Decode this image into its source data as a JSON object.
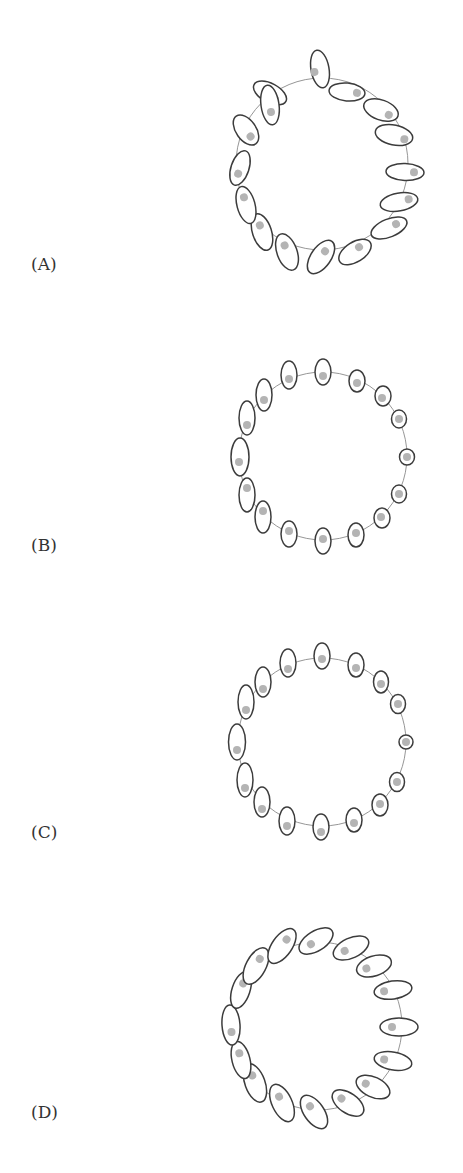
{
  "figure": {
    "colors": {
      "stroke": "#3c3c3c",
      "ring": "#8a8a8a",
      "dot": "#b4b4b4",
      "label": "#333333"
    },
    "panels": [
      {
        "label": "(A)",
        "label_pos": [
          31,
          270
        ],
        "ring": {
          "cx": 322,
          "cy": 164,
          "r": 86
        },
        "ellipses": [
          {
            "cx": 270,
            "cy": 93,
            "rx": 18,
            "ry": 9.5,
            "angle": 28,
            "dot": [
              7,
              3
            ]
          },
          {
            "cx": 320,
            "cy": 69,
            "rx": 19,
            "ry": 9,
            "angle": 80,
            "dot": [
              2,
              6
            ]
          },
          {
            "cx": 347,
            "cy": 92,
            "rx": 18,
            "ry": 9,
            "angle": 5,
            "dot": [
              10,
              0
            ]
          },
          {
            "cx": 381,
            "cy": 110,
            "rx": 18,
            "ry": 10,
            "angle": 20,
            "dot": [
              9,
              2
            ]
          },
          {
            "cx": 394,
            "cy": 135,
            "rx": 19,
            "ry": 10,
            "angle": 12,
            "dot": [
              11,
              2
            ]
          },
          {
            "cx": 405,
            "cy": 172,
            "rx": 19,
            "ry": 8.5,
            "angle": 2,
            "dot": [
              9,
              0
            ]
          },
          {
            "cx": 399,
            "cy": 202,
            "rx": 19,
            "ry": 9,
            "angle": -10,
            "dot": [
              10,
              -1
            ]
          },
          {
            "cx": 389,
            "cy": 228,
            "rx": 19,
            "ry": 9,
            "angle": -22,
            "dot": [
              8,
              -1
            ]
          },
          {
            "cx": 355,
            "cy": 252,
            "rx": 18,
            "ry": 10,
            "angle": -32,
            "dot": [
              6,
              -2
            ]
          },
          {
            "cx": 321,
            "cy": 257,
            "rx": 19,
            "ry": 10,
            "angle": -55,
            "dot": [
              7,
              0
            ]
          },
          {
            "cx": 287,
            "cy": 252,
            "rx": 19,
            "ry": 10,
            "angle": 70,
            "dot": [
              -7,
              0
            ]
          },
          {
            "cx": 262,
            "cy": 232,
            "rx": 19,
            "ry": 9.5,
            "angle": 72,
            "dot": [
              -7,
              0
            ]
          },
          {
            "cx": 246,
            "cy": 205,
            "rx": 19,
            "ry": 9,
            "angle": 75,
            "dot": [
              -8,
              0
            ]
          },
          {
            "cx": 240,
            "cy": 168,
            "rx": 18,
            "ry": 9,
            "angle": -72,
            "dot": [
              -6,
              0
            ]
          },
          {
            "cx": 246,
            "cy": 130,
            "rx": 17,
            "ry": 10,
            "angle": 55,
            "dot": [
              8,
              0
            ]
          },
          {
            "cx": 270,
            "cy": 105,
            "rx": 20,
            "ry": 9,
            "angle": 82,
            "dot": [
              7,
              0
            ]
          }
        ]
      },
      {
        "label": "(B)",
        "label_pos": [
          31,
          551
        ],
        "ring": {
          "cx": 323,
          "cy": 456,
          "r": 84
        },
        "ellipses": [
          {
            "cx": 323,
            "cy": 372,
            "rx": 8,
            "ry": 13,
            "angle": 0,
            "dot": [
              0,
              4
            ]
          },
          {
            "cx": 357,
            "cy": 381,
            "rx": 8,
            "ry": 11,
            "angle": 0,
            "dot": [
              0,
              2
            ]
          },
          {
            "cx": 383,
            "cy": 396,
            "rx": 8,
            "ry": 10,
            "angle": 0,
            "dot": [
              -1,
              2
            ]
          },
          {
            "cx": 399,
            "cy": 419,
            "rx": 7.5,
            "ry": 9,
            "angle": 0,
            "dot": [
              0,
              0
            ]
          },
          {
            "cx": 407,
            "cy": 457,
            "rx": 7.5,
            "ry": 8,
            "angle": 0,
            "dot": [
              0,
              0
            ]
          },
          {
            "cx": 399,
            "cy": 494,
            "rx": 7.5,
            "ry": 9,
            "angle": 0,
            "dot": [
              0,
              0
            ]
          },
          {
            "cx": 382,
            "cy": 518,
            "rx": 8,
            "ry": 10,
            "angle": 0,
            "dot": [
              -1,
              -1
            ]
          },
          {
            "cx": 356,
            "cy": 535,
            "rx": 8,
            "ry": 12,
            "angle": 0,
            "dot": [
              0,
              -2
            ]
          },
          {
            "cx": 323,
            "cy": 541,
            "rx": 8,
            "ry": 13,
            "angle": 0,
            "dot": [
              0,
              -2
            ]
          },
          {
            "cx": 289,
            "cy": 534,
            "rx": 8,
            "ry": 13,
            "angle": 0,
            "dot": [
              0,
              -3
            ]
          },
          {
            "cx": 263,
            "cy": 517,
            "rx": 8,
            "ry": 16,
            "angle": 0,
            "dot": [
              0,
              -6
            ]
          },
          {
            "cx": 247,
            "cy": 495,
            "rx": 8,
            "ry": 17,
            "angle": 0,
            "dot": [
              0,
              -7
            ]
          },
          {
            "cx": 240,
            "cy": 457,
            "rx": 9,
            "ry": 19,
            "angle": 0,
            "dot": [
              -1,
              5
            ]
          },
          {
            "cx": 247,
            "cy": 418,
            "rx": 8,
            "ry": 17,
            "angle": 0,
            "dot": [
              0,
              7
            ]
          },
          {
            "cx": 264,
            "cy": 395,
            "rx": 8,
            "ry": 16,
            "angle": 0,
            "dot": [
              0,
              5
            ]
          },
          {
            "cx": 289,
            "cy": 375,
            "rx": 8,
            "ry": 14,
            "angle": 0,
            "dot": [
              0,
              4
            ]
          }
        ]
      },
      {
        "label": "(C)",
        "label_pos": [
          31,
          838
        ],
        "ring": {
          "cx": 322,
          "cy": 742,
          "r": 84
        },
        "ellipses": [
          {
            "cx": 322,
            "cy": 656,
            "rx": 8,
            "ry": 13,
            "angle": 0,
            "dot": [
              0,
              3
            ]
          },
          {
            "cx": 356,
            "cy": 665,
            "rx": 8,
            "ry": 12,
            "angle": 0,
            "dot": [
              0,
              3
            ]
          },
          {
            "cx": 381,
            "cy": 682,
            "rx": 7.5,
            "ry": 11,
            "angle": 0,
            "dot": [
              0,
              2
            ]
          },
          {
            "cx": 398,
            "cy": 704,
            "rx": 7.5,
            "ry": 9.5,
            "angle": 0,
            "dot": [
              0,
              0
            ]
          },
          {
            "cx": 406,
            "cy": 742,
            "rx": 7,
            "ry": 7,
            "angle": 0,
            "dot": [
              0,
              0
            ]
          },
          {
            "cx": 397,
            "cy": 782,
            "rx": 7.5,
            "ry": 9.5,
            "angle": 0,
            "dot": [
              0,
              0
            ]
          },
          {
            "cx": 380,
            "cy": 805,
            "rx": 8,
            "ry": 11,
            "angle": 0,
            "dot": [
              0,
              -1
            ]
          },
          {
            "cx": 354,
            "cy": 820,
            "rx": 8,
            "ry": 12,
            "angle": 0,
            "dot": [
              0,
              3
            ]
          },
          {
            "cx": 321,
            "cy": 827,
            "rx": 8,
            "ry": 13,
            "angle": 0,
            "dot": [
              0,
              5
            ]
          },
          {
            "cx": 287,
            "cy": 821,
            "rx": 8,
            "ry": 14,
            "angle": 0,
            "dot": [
              0,
              5
            ]
          },
          {
            "cx": 262,
            "cy": 802,
            "rx": 8,
            "ry": 15,
            "angle": 0,
            "dot": [
              0,
              7
            ]
          },
          {
            "cx": 245,
            "cy": 780,
            "rx": 8,
            "ry": 17,
            "angle": 0,
            "dot": [
              0,
              8
            ]
          },
          {
            "cx": 237,
            "cy": 742,
            "rx": 8.5,
            "ry": 18,
            "angle": 0,
            "dot": [
              0,
              8
            ]
          },
          {
            "cx": 246,
            "cy": 702,
            "rx": 8,
            "ry": 17,
            "angle": 0,
            "dot": [
              0,
              8
            ]
          },
          {
            "cx": 263,
            "cy": 682,
            "rx": 8,
            "ry": 15,
            "angle": 0,
            "dot": [
              0,
              7
            ]
          },
          {
            "cx": 288,
            "cy": 663,
            "rx": 8,
            "ry": 14,
            "angle": 0,
            "dot": [
              0,
              6
            ]
          }
        ]
      },
      {
        "label": "(D)",
        "label_pos": [
          31,
          1118
        ],
        "ring": {
          "cx": 318,
          "cy": 1026,
          "r": 84
        },
        "ellipses": [
          {
            "cx": 316,
            "cy": 941,
            "rx": 19,
            "ry": 10,
            "angle": -32,
            "dot": [
              -6,
              0
            ]
          },
          {
            "cx": 351,
            "cy": 948,
            "rx": 19,
            "ry": 10,
            "angle": -25,
            "dot": [
              -7,
              0
            ]
          },
          {
            "cx": 374,
            "cy": 966,
            "rx": 18,
            "ry": 10,
            "angle": -18,
            "dot": [
              -8,
              0
            ]
          },
          {
            "cx": 393,
            "cy": 990,
            "rx": 19,
            "ry": 9,
            "angle": -8,
            "dot": [
              -9,
              0
            ]
          },
          {
            "cx": 399,
            "cy": 1027,
            "rx": 19,
            "ry": 9,
            "angle": 0,
            "dot": [
              -7,
              0
            ]
          },
          {
            "cx": 393,
            "cy": 1061,
            "rx": 19,
            "ry": 9,
            "angle": 10,
            "dot": [
              -9,
              0
            ]
          },
          {
            "cx": 373,
            "cy": 1087,
            "rx": 18,
            "ry": 10,
            "angle": 25,
            "dot": [
              -8,
              0
            ]
          },
          {
            "cx": 348,
            "cy": 1103,
            "rx": 18,
            "ry": 10,
            "angle": 35,
            "dot": [
              -8,
              0
            ]
          },
          {
            "cx": 314,
            "cy": 1112,
            "rx": 19,
            "ry": 10,
            "angle": 55,
            "dot": [
              -7,
              0
            ]
          },
          {
            "cx": 282,
            "cy": 1103,
            "rx": 20,
            "ry": 10,
            "angle": 65,
            "dot": [
              -7,
              0
            ]
          },
          {
            "cx": 255,
            "cy": 1083,
            "rx": 20,
            "ry": 10,
            "angle": 70,
            "dot": [
              -8,
              0
            ]
          },
          {
            "cx": 241,
            "cy": 1060,
            "rx": 19,
            "ry": 9,
            "angle": 76,
            "dot": [
              -7,
              0
            ]
          },
          {
            "cx": 231,
            "cy": 1025,
            "rx": 20,
            "ry": 9,
            "angle": 86,
            "dot": [
              7,
              0
            ]
          },
          {
            "cx": 241,
            "cy": 990,
            "rx": 19,
            "ry": 9,
            "angle": -72,
            "dot": [
              7,
              0
            ]
          },
          {
            "cx": 256,
            "cy": 966,
            "rx": 20,
            "ry": 10,
            "angle": -62,
            "dot": [
              8,
              0
            ]
          },
          {
            "cx": 282,
            "cy": 946,
            "rx": 20,
            "ry": 10,
            "angle": -55,
            "dot": [
              8,
              0
            ]
          }
        ]
      }
    ]
  }
}
